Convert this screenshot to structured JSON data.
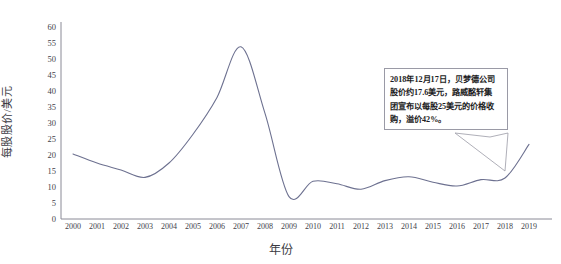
{
  "chart_data": {
    "type": "line",
    "title": "",
    "xlabel": "年份",
    "ylabel": "每股股价/美元",
    "grid": false,
    "legend": "none",
    "line_color": "#6d7190",
    "xlim": [
      2000,
      2019
    ],
    "ylim": [
      0,
      60
    ],
    "ytick_step": 5,
    "x": [
      2000,
      2001,
      2002,
      2003,
      2004,
      2005,
      2006,
      2007,
      2008,
      2009,
      2010,
      2011,
      2012,
      2013,
      2014,
      2015,
      2016,
      2017,
      2018,
      2019
    ],
    "xtick_labels": [
      "2000",
      "2001",
      "2002",
      "2003",
      "2004",
      "2005",
      "2006",
      "2007",
      "2008",
      "2009",
      "2010",
      "2011",
      "2012",
      "2013",
      "2014",
      "2015",
      "2016",
      "2017",
      "2018",
      "2019"
    ],
    "ytick_labels": [
      "0",
      "5",
      "10",
      "15",
      "20",
      "25",
      "30",
      "35",
      "40",
      "45",
      "50",
      "55",
      "60"
    ],
    "values": [
      20.3,
      17.5,
      15.3,
      13.0,
      17.5,
      26.5,
      38.0,
      53.8,
      33.0,
      7.0,
      11.8,
      11.0,
      9.3,
      12.0,
      13.2,
      11.5,
      10.3,
      12.3,
      12.8,
      23.3
    ],
    "series": [
      {
        "name": "每股股价",
        "values": [
          20.3,
          17.5,
          15.3,
          13.0,
          17.5,
          26.5,
          38.0,
          53.8,
          33.0,
          7.0,
          11.8,
          11.0,
          9.3,
          12.0,
          13.2,
          11.5,
          10.3,
          12.3,
          12.8,
          23.3
        ]
      }
    ],
    "annotations": [
      {
        "name": "acquisition-callout",
        "lines": [
          "2018年12月17日，贝梦德公司",
          "股价约17.6美元，路威酩轩集",
          "团宣布以每股25美元的价格收",
          "购，溢价42%。"
        ],
        "points_to_year": 2018,
        "points_to_value": 17.6
      }
    ]
  }
}
